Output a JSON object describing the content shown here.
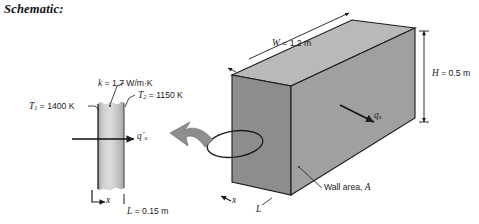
{
  "heading": "Schematic:",
  "diagram": {
    "box": {
      "label_width": "W = 1.2 m",
      "width_symbol": "W",
      "width_value": "1.2 m",
      "label_height": "H = 0.5 m",
      "height_symbol": "H",
      "height_value": "0.5 m",
      "label_thickness": "L",
      "label_axis": "x",
      "label_heat_rate": "q",
      "heat_rate_subscript": "x",
      "label_wall_area": "Wall area, A",
      "face_color": "#9e9e9e",
      "top_color": "#b8b8b8",
      "side_color": "#8e8e8e",
      "edge_color": "#1a1a1a"
    },
    "slab": {
      "label_k": "k = 1.7 W/m·K",
      "k_symbol": "k",
      "k_value": "1.7 W/m·K",
      "label_T1": "T",
      "T1_subscript": "1",
      "T1_value": "= 1400 K",
      "label_T2": "T",
      "T2_subscript": "2",
      "T2_value": "= 1150 K",
      "label_flux": "q",
      "flux_subscript": "x",
      "flux_superscript": "″",
      "label_L": "L = 0.15 m",
      "L_symbol": "L",
      "L_value": "0.15 m",
      "label_axis": "x",
      "fill_light": "#d3d3d3",
      "fill_dark": "#9a9a9a"
    },
    "callout": {
      "name": "magnify-callout-arrow",
      "arrow_color": "#8a8a8a",
      "ellipse_color": "#1a1a1a"
    }
  }
}
